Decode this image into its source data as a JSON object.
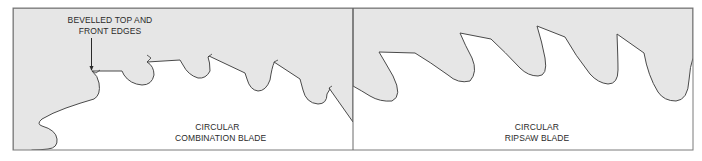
{
  "figure": {
    "colors": {
      "blade_fill": "#e6e6e6",
      "outline": "#4a4a4a",
      "frame": "#7a7a7a",
      "background": "#ffffff",
      "text": "#2a2a2a"
    },
    "panels": [
      {
        "id": "combination",
        "label_line1": "CIRCULAR",
        "label_line2": "COMBINATION BLADE",
        "callout": {
          "line1": "BEVELLED TOP AND",
          "line2": "FRONT EDGES",
          "arrow": "arrow-down-icon"
        }
      },
      {
        "id": "ripsaw",
        "label_line1": "CIRCULAR",
        "label_line2": "RIPSAW BLADE"
      }
    ]
  }
}
